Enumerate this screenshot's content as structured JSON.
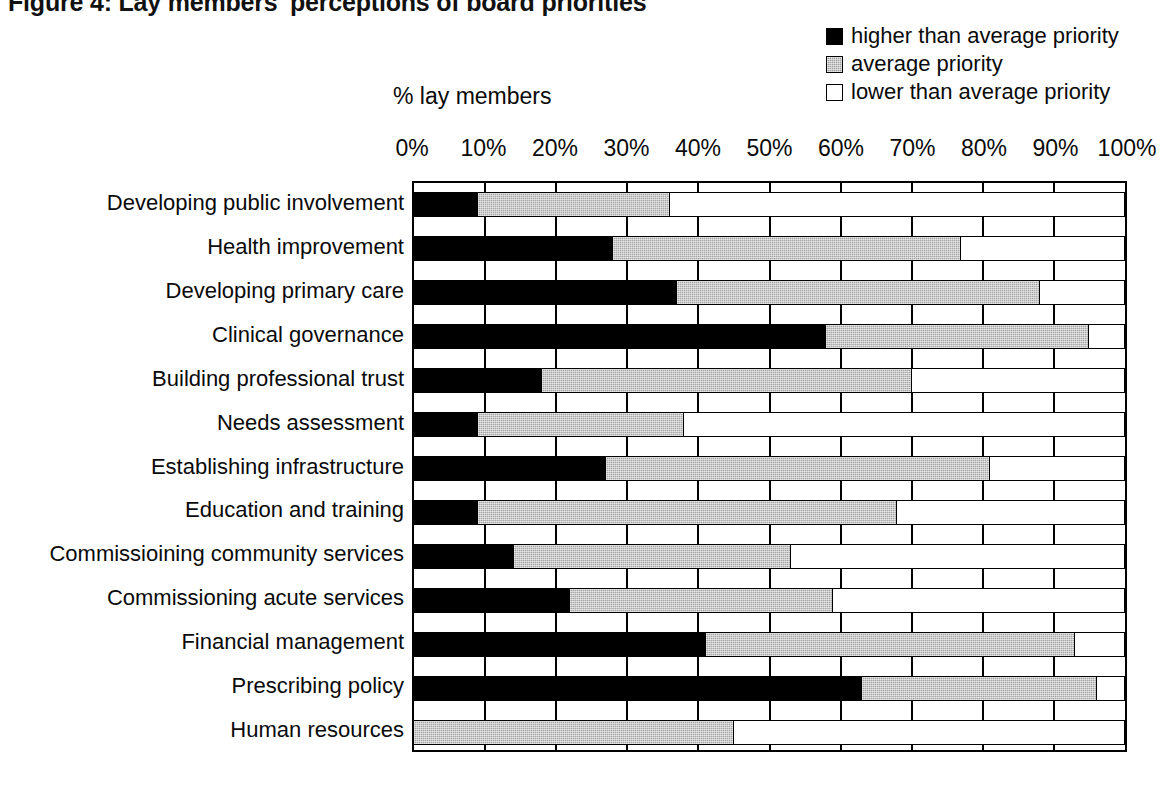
{
  "figure": {
    "title": "Figure 4: Lay members' perceptions of board priorities"
  },
  "legend": {
    "position": "top-right",
    "items": [
      {
        "label": "higher than average priority",
        "swatch": "black-square-icon",
        "color": "#000000"
      },
      {
        "label": "average priority",
        "swatch": "gray-square-icon",
        "color": "#a6a6a6"
      },
      {
        "label": "lower than average priority",
        "swatch": "white-square-icon",
        "color": "#ffffff"
      }
    ]
  },
  "axis": {
    "title": "% lay members",
    "ticks": [
      "0%",
      "10%",
      "20%",
      "30%",
      "40%",
      "50%",
      "60%",
      "70%",
      "80%",
      "90%",
      "100%"
    ]
  },
  "chart_data": {
    "type": "bar",
    "orientation": "horizontal",
    "stacked": true,
    "title": "Figure 4: Lay members' perceptions of board priorities",
    "xlabel": "% lay members",
    "ylabel": "",
    "xlim": [
      0,
      100
    ],
    "xticks": [
      0,
      10,
      20,
      30,
      40,
      50,
      60,
      70,
      80,
      90,
      100
    ],
    "grid": true,
    "legend_position": "top-right",
    "categories": [
      "Developing public involvement",
      "Health improvement",
      "Developing primary care",
      "Clinical governance",
      "Building professional trust",
      "Needs assessment",
      "Establishing infrastructure",
      "Education and training",
      "Commissioining community services",
      "Commissioning acute services",
      "Financial management",
      "Prescribing policy",
      "Human resources"
    ],
    "series": [
      {
        "name": "higher than average priority",
        "color": "#000000",
        "values": [
          9,
          28,
          37,
          58,
          18,
          9,
          27,
          9,
          14,
          22,
          41,
          63,
          0
        ]
      },
      {
        "name": "average priority",
        "color": "#a6a6a6",
        "values": [
          27,
          49,
          51,
          37,
          52,
          29,
          54,
          59,
          39,
          37,
          52,
          33,
          45
        ]
      },
      {
        "name": "lower than average priority",
        "color": "#ffffff",
        "values": [
          64,
          23,
          12,
          5,
          30,
          62,
          19,
          32,
          47,
          41,
          7,
          4,
          55
        ]
      }
    ],
    "cumulative_ends": {
      "higher": [
        9,
        28,
        37,
        58,
        18,
        9,
        27,
        9,
        14,
        22,
        41,
        63,
        0
      ],
      "higher_plus_average": [
        36,
        77,
        88,
        95,
        70,
        38,
        81,
        68,
        53,
        59,
        93,
        96,
        45
      ]
    }
  }
}
